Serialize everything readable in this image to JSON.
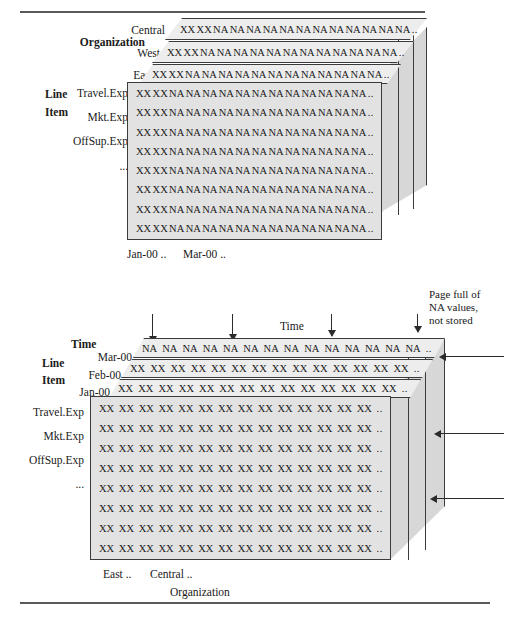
{
  "figure": {
    "title_top_rule": "horizontal-rule",
    "title_bottom_rule": "horizontal-rule"
  },
  "top_diagram": {
    "axis_labels": {
      "organization": "Organization",
      "line": "Line",
      "item": "Item"
    },
    "org_slabs": [
      "Central",
      "West",
      "East"
    ],
    "line_items": [
      "Travel.Exp",
      "Mkt.Exp",
      "OffSup.Exp",
      "..."
    ],
    "time_ticks": [
      "Jan-00 ..",
      "Mar-00 .."
    ],
    "slab_cells": [
      "XX",
      "XX",
      "NA",
      "NA",
      "NA",
      "NA",
      "NA",
      "NA",
      "NA",
      "NA",
      "NA",
      "NA",
      "NA",
      "NA",
      ".."
    ],
    "front_row_cells": [
      "XX",
      "XX",
      "NA",
      "NA",
      "NA",
      "NA",
      "NA",
      "NA",
      "NA",
      "NA",
      "NA",
      "NA",
      "NA",
      "NA",
      ".."
    ],
    "front_row_count": 8,
    "side_panel_count": 2
  },
  "bottom_diagram": {
    "axis_labels": {
      "time": "Time",
      "line": "Line",
      "item": "Item",
      "time_top": "Time",
      "organization": "Organization"
    },
    "time_slabs": [
      "Mar-00",
      "Feb-00",
      "Jan-00"
    ],
    "line_items": [
      "Travel.Exp",
      "Mkt.Exp",
      "OffSup.Exp",
      "..."
    ],
    "org_ticks": [
      "East ..",
      "Central .."
    ],
    "na_slab_cells": [
      "NA",
      "NA",
      "NA",
      "NA",
      "NA",
      "NA",
      "NA",
      "NA",
      "NA",
      "NA",
      "NA",
      "NA",
      "NA",
      "NA",
      ".."
    ],
    "xx_slab_cells": [
      "XX",
      "XX",
      "XX",
      "XX",
      "XX",
      "XX",
      "XX",
      "XX",
      "XX",
      "XX",
      "XX",
      "XX",
      "XX",
      "XX",
      ".."
    ],
    "front_row_cells": [
      "XX",
      "XX",
      "XX",
      "XX",
      "XX",
      "XX",
      "XX",
      "XX",
      "XX",
      "XX",
      "XX",
      "XX",
      "XX",
      "XX",
      ".."
    ],
    "front_row_count": 8,
    "side_panel_count": 2,
    "annotation": "Page full of\nNA values,\nnot stored",
    "down_arrow_count": 4,
    "side_arrow_count": 3
  },
  "colors": {
    "front_face": "#e2e2e2",
    "slab_face": "#ededed",
    "side_face": "#d7d7d7",
    "stroke": "#3b3b3b",
    "rule": "#5a5a5a"
  }
}
